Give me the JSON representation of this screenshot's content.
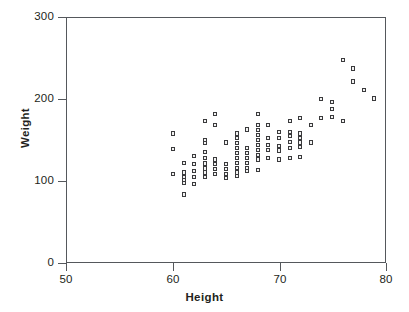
{
  "chart_data": {
    "type": "scatter",
    "title": "",
    "xlabel": "Height",
    "ylabel": "Weight",
    "xlim": [
      50,
      80
    ],
    "ylim": [
      0,
      300
    ],
    "xticks": [
      50,
      60,
      70,
      80
    ],
    "yticks": [
      0,
      100,
      200,
      300
    ],
    "xtick_labels": [
      "50",
      "60",
      "70",
      "80"
    ],
    "ytick_labels": [
      "0",
      "100",
      "200",
      "300"
    ],
    "grid": false,
    "legend": false,
    "marker": "open-square",
    "marker_color": "#3a3a3c",
    "axis_color": "#55585c",
    "background": "#ffffff",
    "series": [
      {
        "name": "observations",
        "points": [
          [
            60,
            158
          ],
          [
            60,
            139
          ],
          [
            60,
            108
          ],
          [
            61,
            122
          ],
          [
            61,
            110
          ],
          [
            61,
            105
          ],
          [
            61,
            101
          ],
          [
            61,
            97
          ],
          [
            61,
            83
          ],
          [
            62,
            130
          ],
          [
            62,
            120
          ],
          [
            62,
            112
          ],
          [
            62,
            105
          ],
          [
            62,
            96
          ],
          [
            63,
            173
          ],
          [
            63,
            150
          ],
          [
            63,
            146
          ],
          [
            63,
            135
          ],
          [
            63,
            128
          ],
          [
            63,
            121
          ],
          [
            63,
            115
          ],
          [
            63,
            110
          ],
          [
            63,
            105
          ],
          [
            64,
            182
          ],
          [
            64,
            168
          ],
          [
            64,
            126
          ],
          [
            64,
            120
          ],
          [
            64,
            114
          ],
          [
            64,
            108
          ],
          [
            65,
            147
          ],
          [
            65,
            120
          ],
          [
            65,
            114
          ],
          [
            65,
            108
          ],
          [
            65,
            103
          ],
          [
            66,
            158
          ],
          [
            66,
            152
          ],
          [
            66,
            146
          ],
          [
            66,
            140
          ],
          [
            66,
            134
          ],
          [
            66,
            128
          ],
          [
            66,
            122
          ],
          [
            66,
            116
          ],
          [
            66,
            110
          ],
          [
            66,
            106
          ],
          [
            67,
            163
          ],
          [
            67,
            140
          ],
          [
            67,
            134
          ],
          [
            67,
            128
          ],
          [
            67,
            122
          ],
          [
            67,
            116
          ],
          [
            67,
            112
          ],
          [
            68,
            182
          ],
          [
            68,
            168
          ],
          [
            68,
            162
          ],
          [
            68,
            156
          ],
          [
            68,
            150
          ],
          [
            68,
            144
          ],
          [
            68,
            138
          ],
          [
            68,
            132
          ],
          [
            68,
            126
          ],
          [
            68,
            113
          ],
          [
            69,
            168
          ],
          [
            69,
            152
          ],
          [
            69,
            144
          ],
          [
            69,
            138
          ],
          [
            69,
            128
          ],
          [
            70,
            160
          ],
          [
            70,
            152
          ],
          [
            70,
            143
          ],
          [
            70,
            137
          ],
          [
            70,
            126
          ],
          [
            71,
            173
          ],
          [
            71,
            160
          ],
          [
            71,
            155
          ],
          [
            71,
            148
          ],
          [
            71,
            140
          ],
          [
            71,
            128
          ],
          [
            72,
            177
          ],
          [
            72,
            158
          ],
          [
            72,
            152
          ],
          [
            72,
            147
          ],
          [
            72,
            141
          ],
          [
            72,
            129
          ],
          [
            73,
            168
          ],
          [
            73,
            147
          ],
          [
            74,
            200
          ],
          [
            74,
            177
          ],
          [
            75,
            197
          ],
          [
            75,
            188
          ],
          [
            75,
            178
          ],
          [
            76,
            248
          ],
          [
            76,
            173
          ],
          [
            77,
            238
          ],
          [
            77,
            222
          ],
          [
            78,
            211
          ],
          [
            79,
            201
          ]
        ]
      }
    ]
  },
  "axes": {
    "y_title": "Weight",
    "x_title": "Height"
  }
}
